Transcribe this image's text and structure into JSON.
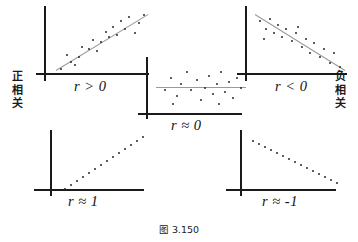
{
  "figure": {
    "caption": "图 3.150",
    "left_label": [
      "正",
      "相",
      "关"
    ],
    "right_label": [
      "负",
      "相",
      "关"
    ]
  },
  "panels": [
    {
      "id": "positive-correlation",
      "label": "r > 0",
      "points": [
        [
          12,
          62
        ],
        [
          22,
          55
        ],
        [
          18,
          48
        ],
        [
          30,
          50
        ],
        [
          33,
          40
        ],
        [
          40,
          42
        ],
        [
          44,
          33
        ],
        [
          52,
          35
        ],
        [
          57,
          25
        ],
        [
          60,
          30
        ],
        [
          64,
          20
        ],
        [
          68,
          28
        ],
        [
          72,
          14
        ],
        [
          76,
          22
        ],
        [
          80,
          10
        ],
        [
          86,
          26
        ],
        [
          90,
          16
        ],
        [
          95,
          8
        ],
        [
          26,
          58
        ],
        [
          48,
          44
        ]
      ],
      "trend": {
        "x1": 8,
        "y1": 64,
        "x2": 100,
        "y2": 8
      }
    },
    {
      "id": "near-zero-correlation",
      "label": "r ≈ 0",
      "points": [
        [
          14,
          30
        ],
        [
          20,
          18
        ],
        [
          26,
          36
        ],
        [
          30,
          24
        ],
        [
          36,
          12
        ],
        [
          40,
          30
        ],
        [
          46,
          20
        ],
        [
          50,
          40
        ],
        [
          54,
          28
        ],
        [
          58,
          16
        ],
        [
          62,
          34
        ],
        [
          66,
          24
        ],
        [
          70,
          12
        ],
        [
          74,
          32
        ],
        [
          78,
          22
        ],
        [
          82,
          38
        ],
        [
          86,
          18
        ],
        [
          90,
          28
        ],
        [
          22,
          44
        ],
        [
          68,
          44
        ]
      ],
      "trend": {
        "x1": 6,
        "y1": 28,
        "x2": 96,
        "y2": 28
      }
    },
    {
      "id": "negative-correlation",
      "label": "r < 0",
      "points": [
        [
          10,
          14
        ],
        [
          16,
          22
        ],
        [
          20,
          12
        ],
        [
          24,
          26
        ],
        [
          28,
          18
        ],
        [
          32,
          30
        ],
        [
          36,
          22
        ],
        [
          42,
          34
        ],
        [
          46,
          26
        ],
        [
          52,
          40
        ],
        [
          56,
          32
        ],
        [
          60,
          46
        ],
        [
          64,
          36
        ],
        [
          70,
          50
        ],
        [
          74,
          42
        ],
        [
          80,
          56
        ],
        [
          84,
          46
        ],
        [
          90,
          60
        ],
        [
          14,
          32
        ],
        [
          48,
          20
        ]
      ],
      "trend": {
        "x1": 6,
        "y1": 8,
        "x2": 96,
        "y2": 64
      }
    },
    {
      "id": "perfect-positive-correlation",
      "label": "r ≈ 1",
      "points": [
        [
          8,
          58
        ],
        [
          14,
          54
        ],
        [
          20,
          50
        ],
        [
          26,
          46
        ],
        [
          32,
          42
        ],
        [
          38,
          38
        ],
        [
          44,
          34
        ],
        [
          50,
          30
        ],
        [
          56,
          26
        ],
        [
          62,
          22
        ],
        [
          68,
          18
        ],
        [
          74,
          14
        ],
        [
          80,
          10
        ],
        [
          86,
          6
        ]
      ],
      "trend": null
    },
    {
      "id": "perfect-negative-correlation",
      "label": "r ≈ -1",
      "points": [
        [
          8,
          8
        ],
        [
          14,
          11
        ],
        [
          20,
          14
        ],
        [
          26,
          17
        ],
        [
          32,
          20
        ],
        [
          38,
          23
        ],
        [
          44,
          26
        ],
        [
          50,
          29
        ],
        [
          56,
          32
        ],
        [
          62,
          35
        ],
        [
          68,
          38
        ],
        [
          74,
          41
        ],
        [
          80,
          44
        ],
        [
          86,
          47
        ],
        [
          92,
          50
        ]
      ],
      "trend": null
    }
  ]
}
